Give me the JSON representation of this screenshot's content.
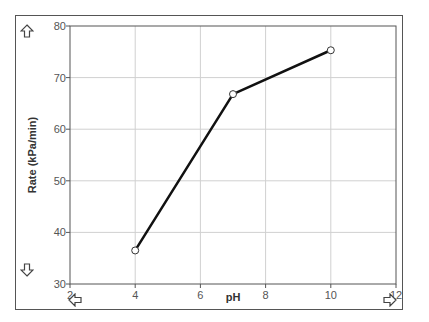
{
  "chart_data": {
    "type": "line",
    "title": "",
    "xlabel": "pH",
    "ylabel": "Rate (kPa/min)",
    "xlim": [
      2,
      12
    ],
    "ylim": [
      30,
      80
    ],
    "x_ticks": [
      2,
      4,
      6,
      8,
      10,
      12
    ],
    "y_ticks": [
      30,
      40,
      50,
      60,
      70,
      80
    ],
    "grid": true,
    "legend": null,
    "series": [
      {
        "name": "Rate",
        "x": [
          4,
          7,
          10
        ],
        "values": [
          36.5,
          66.8,
          75.3
        ],
        "color": "#111111",
        "marker": "open-circle"
      }
    ]
  },
  "axes": {
    "x_label": "pH",
    "y_label": "Rate (kPa/min)",
    "x_tick_labels": [
      "2",
      "4",
      "6",
      "8",
      "10",
      "12"
    ],
    "y_tick_labels": [
      "30",
      "40",
      "50",
      "60",
      "70",
      "80"
    ]
  },
  "navigation": {
    "up_icon": "up-arrow-icon",
    "down_icon": "down-arrow-icon",
    "left_icon": "left-arrow-icon",
    "right_icon": "right-arrow-icon"
  },
  "colors": {
    "line": "#111111",
    "grid": "#d0d0d0",
    "axis": "#555555",
    "frame": "#555555"
  }
}
